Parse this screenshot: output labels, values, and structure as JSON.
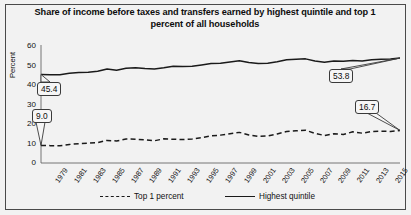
{
  "chart_data": {
    "type": "line",
    "title": "Share of income before taxes and transfers earned by highest quintile and top 1 percent of all households",
    "xlabel": "",
    "ylabel": "Percent",
    "ylim": [
      0,
      60
    ],
    "yticks": [
      0,
      10,
      20,
      30,
      40,
      50,
      60
    ],
    "grid": false,
    "legend_position": "bottom",
    "x": [
      1979,
      1980,
      1981,
      1982,
      1983,
      1984,
      1985,
      1986,
      1987,
      1988,
      1989,
      1990,
      1991,
      1992,
      1993,
      1994,
      1995,
      1996,
      1997,
      1998,
      1999,
      2000,
      2001,
      2002,
      2003,
      2004,
      2005,
      2006,
      2007,
      2008,
      2009,
      2010,
      2011,
      2012,
      2013,
      2014,
      2015,
      2016,
      2017
    ],
    "xtick_labels": [
      "1979",
      "1981",
      "1983",
      "1985",
      "1987",
      "1989",
      "1991",
      "1993",
      "1995",
      "1997",
      "1999",
      "2001",
      "2003",
      "2005",
      "2007",
      "2009",
      "2011",
      "2013",
      "2015",
      "2017"
    ],
    "series": [
      {
        "name": "Highest quintile",
        "style": "solid",
        "color": "#1a1a1a",
        "values": [
          45.4,
          45.2,
          45.3,
          46.0,
          46.4,
          46.6,
          47.0,
          48.2,
          47.6,
          48.6,
          48.9,
          48.4,
          48.2,
          48.8,
          49.6,
          49.5,
          49.6,
          50.3,
          51.0,
          51.2,
          51.8,
          52.4,
          51.5,
          51.0,
          51.2,
          51.9,
          52.9,
          53.2,
          53.4,
          52.3,
          51.7,
          52.3,
          52.2,
          52.6,
          52.3,
          53.0,
          53.2,
          53.3,
          53.8
        ]
      },
      {
        "name": "Top 1 percent",
        "style": "dashed",
        "color": "#1a1a1a",
        "values": [
          9.0,
          8.9,
          8.8,
          9.5,
          9.9,
          10.2,
          10.5,
          11.6,
          11.3,
          12.3,
          12.2,
          11.9,
          11.4,
          12.4,
          12.2,
          12.0,
          12.3,
          13.0,
          13.9,
          14.3,
          15.0,
          15.7,
          14.4,
          13.7,
          13.9,
          14.9,
          16.1,
          16.5,
          16.8,
          15.2,
          14.1,
          15.0,
          14.6,
          16.0,
          15.3,
          16.1,
          16.3,
          16.2,
          16.7
        ]
      }
    ],
    "annotations": [
      {
        "label": "45.4",
        "series": "Highest quintile",
        "x": 1979,
        "value": 45.4
      },
      {
        "label": "9.0",
        "series": "Top 1 percent",
        "x": 1979,
        "value": 9.0
      },
      {
        "label": "53.8",
        "series": "Highest quintile",
        "x": 2017,
        "value": 53.8
      },
      {
        "label": "16.7",
        "series": "Top 1 percent",
        "x": 2017,
        "value": 16.7
      }
    ]
  }
}
